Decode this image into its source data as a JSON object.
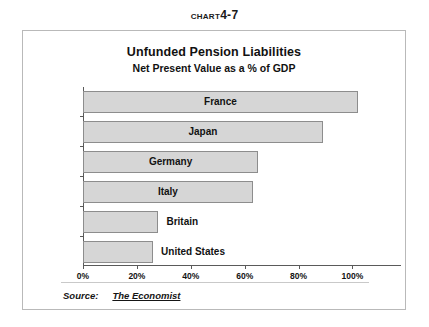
{
  "caption": {
    "word": "Chart",
    "number": "4-7"
  },
  "chart_data": {
    "type": "bar",
    "orientation": "horizontal",
    "title": "Unfunded Pension Liabilities",
    "subtitle": "Net Present Value as a % of GDP",
    "xlabel": "",
    "ylabel": "",
    "categories": [
      "France",
      "Japan",
      "Germany",
      "Italy",
      "Britain",
      "United States"
    ],
    "values": [
      102,
      89,
      65,
      63,
      28,
      26
    ],
    "value_unit": "%",
    "xlim": [
      0,
      118
    ],
    "xticks": [
      0,
      20,
      40,
      60,
      80,
      100
    ],
    "xticklabels": [
      "0%",
      "20%",
      "40%",
      "60%",
      "80%",
      "100%"
    ],
    "label_placement": [
      "inside",
      "inside",
      "inside",
      "inside",
      "outside",
      "outside"
    ],
    "grid": false,
    "legend": false,
    "bar_fill": "#d6d6d6",
    "bar_border": "#8d8d8d",
    "axis_color": "#5a5a5a"
  },
  "source": {
    "label": "Source:",
    "value": "The Economist"
  }
}
